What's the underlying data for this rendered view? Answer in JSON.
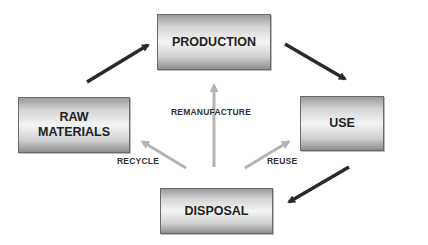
{
  "diagram": {
    "nodes": [
      {
        "id": "production",
        "label": "PRODUCTION"
      },
      {
        "id": "raw_materials",
        "label": "RAW\nMATERIALS"
      },
      {
        "id": "use",
        "label": "USE"
      },
      {
        "id": "disposal",
        "label": "DISPOSAL"
      }
    ],
    "edges": [
      {
        "from": "raw_materials",
        "to": "production",
        "label": "",
        "color": "#2a2a2a"
      },
      {
        "from": "production",
        "to": "use",
        "label": "",
        "color": "#2a2a2a"
      },
      {
        "from": "use",
        "to": "disposal",
        "label": "",
        "color": "#2a2a2a"
      },
      {
        "from": "disposal",
        "to": "raw_materials",
        "label": "RECYCLE",
        "color": "#b4b4b4"
      },
      {
        "from": "disposal",
        "to": "production",
        "label": "REMANUFACTURE",
        "color": "#b4b4b4"
      },
      {
        "from": "disposal",
        "to": "use",
        "label": "REUSE",
        "color": "#b4b4b4"
      }
    ],
    "labels": {
      "recycle": "RECYCLE",
      "remanufacture": "REMANUFACTURE",
      "reuse": "REUSE"
    },
    "colors": {
      "main_arrow": "#2a2a2a",
      "return_arrow": "#b4b4b4"
    }
  }
}
